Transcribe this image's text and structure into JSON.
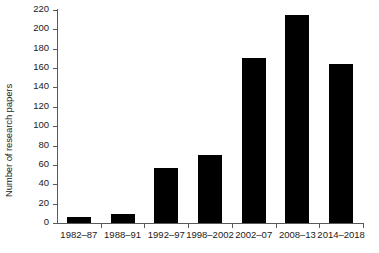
{
  "chart_data": {
    "type": "bar",
    "title": "",
    "subtitle": "",
    "xlabel": "",
    "ylabel": "Number of research papers",
    "categories": [
      "1982–87",
      "1988–91",
      "1992–97",
      "1998–2002",
      "2002–07",
      "2008–13",
      "2014–2018"
    ],
    "values": [
      6,
      9,
      57,
      70,
      170,
      215,
      164
    ],
    "ylim": [
      0,
      220
    ],
    "yticks": [
      0,
      20,
      40,
      60,
      80,
      100,
      120,
      140,
      160,
      180,
      200,
      220
    ],
    "ytick_labels": [
      "0",
      "20",
      "40",
      "60",
      "80",
      "100",
      "120",
      "140",
      "160",
      "180",
      "200",
      "220"
    ],
    "grid": false,
    "legend": null,
    "bar_color": "#000000",
    "axis_color": "#555a5e",
    "background": "#ffffff"
  }
}
